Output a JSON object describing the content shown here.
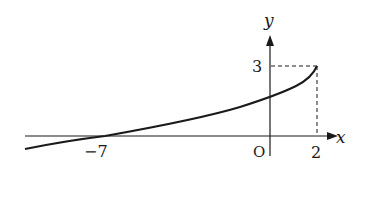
{
  "diagram": {
    "type": "function-graph",
    "axes": {
      "x_label": "x",
      "y_label": "y",
      "origin_label": "O"
    },
    "ticks": {
      "x_neg": "−7",
      "x_pos": "2",
      "y_val": "3"
    },
    "curve": {
      "description": "increasing concave-up curve ending at (2,3), crossing x-axis at x=-7",
      "x_intercept": -7,
      "endpoint": [
        2,
        3
      ]
    },
    "guides": {
      "dashed_to_endpoint": true
    },
    "colors": {
      "ink": "#1a1a1a",
      "background": "#ffffff"
    }
  }
}
